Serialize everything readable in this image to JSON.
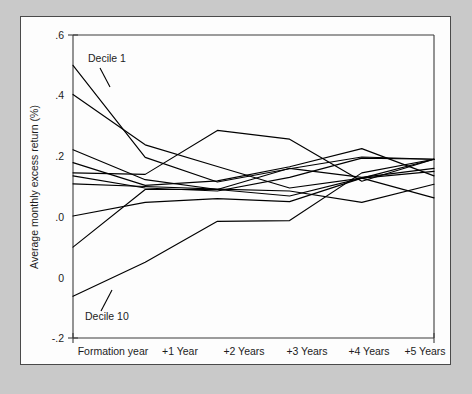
{
  "figure": {
    "background_color": "#c9c9c9",
    "panel_color": "#fdfdfd",
    "panel_border_color": "#4a4a4a",
    "line_color": "#000000"
  },
  "annotations": {
    "top_label": "Decile 1",
    "bottom_label": "Decile 10"
  },
  "chart_data": {
    "type": "line",
    "title": "",
    "xlabel": "",
    "ylabel": "Average monthly excess return (%)",
    "categories": [
      "Formation year",
      "+1 Year",
      "+2 Years",
      "+3 Years",
      "+4 Years",
      "+5 Years"
    ],
    "x": [
      0,
      1,
      2,
      3,
      4,
      5
    ],
    "xlim": [
      0,
      5
    ],
    "ylim": [
      -0.2,
      0.6
    ],
    "yticks": [
      0.6,
      0.4,
      0.2,
      0.0,
      0.0,
      -0.2
    ],
    "ytick_labels": [
      ".6",
      ".4",
      ".2",
      ".0",
      "0",
      "-.2"
    ],
    "grid": false,
    "legend": "none",
    "series": [
      {
        "name": "Decile 1",
        "values": [
          0.52,
          0.277,
          0.212,
          0.247,
          0.278,
          0.272
        ]
      },
      {
        "name": "Decile 2",
        "values": [
          0.443,
          0.31,
          0.253,
          0.196,
          0.222,
          0.272
        ]
      },
      {
        "name": "Decile 3",
        "values": [
          0.297,
          0.218,
          0.192,
          0.248,
          0.224,
          0.248
        ]
      },
      {
        "name": "Decile 4",
        "values": [
          0.263,
          0.203,
          0.215,
          0.252,
          0.3,
          0.228
        ]
      },
      {
        "name": "Decile 5",
        "values": [
          0.236,
          0.232,
          0.348,
          0.325,
          0.214,
          0.272
        ]
      },
      {
        "name": "Decile 6",
        "values": [
          0.228,
          0.196,
          0.188,
          0.224,
          0.275,
          0.272
        ]
      },
      {
        "name": "Decile 7",
        "values": [
          0.207,
          0.2,
          0.193,
          0.188,
          0.158,
          0.206
        ]
      },
      {
        "name": "Decile 8",
        "values": [
          0.122,
          0.158,
          0.168,
          0.16,
          0.222,
          0.24
        ]
      },
      {
        "name": "Decile 9",
        "values": [
          0.04,
          0.192,
          0.192,
          0.175,
          0.222,
          0.17
        ]
      },
      {
        "name": "Decile 10",
        "values": [
          -0.09,
          0.0,
          0.108,
          0.11,
          0.236,
          0.272
        ]
      }
    ]
  }
}
